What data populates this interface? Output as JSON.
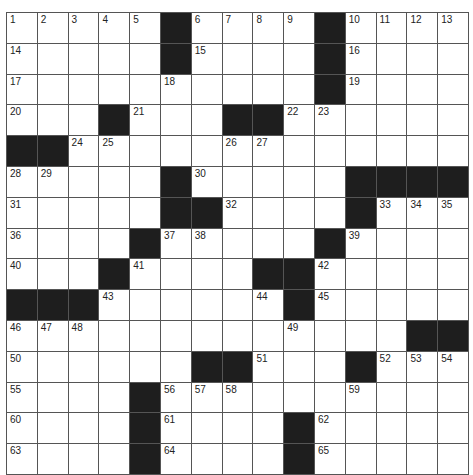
{
  "puzzle": {
    "rows": 15,
    "cols": 15,
    "colors": {
      "background": "#ffffff",
      "block": "#1e1e1e",
      "gridline": "#555555",
      "number": "#222222"
    },
    "grid": [
      [
        "1",
        "2",
        "3",
        "4",
        "5",
        "#",
        "6",
        "7",
        "8",
        "9",
        "#",
        "10",
        "11",
        "12",
        "13"
      ],
      [
        "14",
        "",
        "",
        "",
        "",
        "#",
        "15",
        "",
        "",
        "",
        "#",
        "16",
        "",
        "",
        ""
      ],
      [
        "17",
        "",
        "",
        "",
        "",
        "18",
        "",
        "",
        "",
        "",
        "#",
        "19",
        "",
        "",
        ""
      ],
      [
        "20",
        "",
        "",
        "#",
        "21",
        "",
        "",
        "#",
        "#",
        "22",
        "23",
        "",
        "",
        "",
        ""
      ],
      [
        "#",
        "#",
        "24",
        "25",
        "",
        "",
        "",
        "26",
        "27",
        "",
        "",
        "",
        "",
        "",
        ""
      ],
      [
        "28",
        "29",
        "",
        "",
        "",
        "#",
        "30",
        "",
        "",
        "",
        "",
        "#",
        "#",
        "#",
        "#"
      ],
      [
        "31",
        "",
        "",
        "",
        "",
        "#",
        "#",
        "32",
        "",
        "",
        "",
        "#",
        "33",
        "34",
        "35"
      ],
      [
        "36",
        "",
        "",
        "",
        "#",
        "37",
        "38",
        "",
        "",
        "",
        "#",
        "39",
        "",
        "",
        ""
      ],
      [
        "40",
        "",
        "",
        "#",
        "41",
        "",
        "",
        "",
        "#",
        "#",
        "42",
        "",
        "",
        "",
        ""
      ],
      [
        "#",
        "#",
        "#",
        "43",
        "",
        "",
        "",
        "",
        "44",
        "#",
        "45",
        "",
        "",
        "",
        ""
      ],
      [
        "46",
        "47",
        "48",
        "",
        "",
        "",
        "",
        "",
        "",
        "49",
        "",
        "",
        "",
        "#",
        "#"
      ],
      [
        "50",
        "",
        "",
        "",
        "",
        "",
        "#",
        "#",
        "51",
        "",
        "",
        "#",
        "52",
        "53",
        "54"
      ],
      [
        "55",
        "",
        "",
        "",
        "#",
        "56",
        "57",
        "58",
        "",
        "",
        "",
        "59",
        "",
        "",
        ""
      ],
      [
        "60",
        "",
        "",
        "",
        "#",
        "61",
        "",
        "",
        "",
        "#",
        "62",
        "",
        "",
        "",
        ""
      ],
      [
        "63",
        "",
        "",
        "",
        "#",
        "64",
        "",
        "",
        "",
        "#",
        "65",
        "",
        "",
        "",
        ""
      ]
    ],
    "letters": [
      [
        "",
        "",
        "",
        "",
        "",
        "",
        "",
        "",
        "",
        "",
        "",
        "",
        "",
        "",
        ""
      ],
      [
        "",
        "",
        "",
        "",
        "",
        "",
        "",
        "",
        "",
        "",
        "",
        "",
        "",
        "",
        ""
      ],
      [
        "",
        "",
        "",
        "",
        "",
        "",
        "",
        "",
        "",
        "",
        "",
        "",
        "",
        "",
        ""
      ],
      [
        "",
        "",
        "",
        "",
        "",
        "",
        "",
        "",
        "",
        "",
        "",
        "",
        "",
        "",
        ""
      ],
      [
        "",
        "",
        "",
        "",
        "",
        "",
        "",
        "",
        "",
        "",
        "",
        "",
        "",
        "",
        ""
      ],
      [
        "",
        "",
        "",
        "",
        "",
        "",
        "",
        "",
        "",
        "",
        "",
        "",
        "",
        "",
        ""
      ],
      [
        "",
        "",
        "",
        "",
        "",
        "",
        "",
        "",
        "",
        "",
        "",
        "",
        "",
        "",
        ""
      ],
      [
        "",
        "",
        "",
        "",
        "",
        "",
        "",
        "",
        "",
        "",
        "",
        "",
        "",
        "",
        ""
      ],
      [
        "",
        "",
        "",
        "",
        "",
        "",
        "",
        "",
        "",
        "",
        "",
        "",
        "",
        "",
        ""
      ],
      [
        "",
        "",
        "",
        "",
        "",
        "",
        "",
        "",
        "",
        "",
        "",
        "",
        "",
        "",
        ""
      ],
      [
        "",
        "",
        "",
        "",
        "",
        "",
        "",
        "",
        "",
        "",
        "",
        "",
        "",
        "",
        ""
      ],
      [
        "",
        "",
        "",
        "",
        "",
        "",
        "",
        "",
        "",
        "",
        "",
        "",
        "",
        "",
        ""
      ],
      [
        "",
        "",
        "",
        "",
        "",
        "",
        "",
        "",
        "",
        "",
        "",
        "",
        "",
        "",
        ""
      ],
      [
        "",
        "",
        "",
        "",
        "",
        "",
        "",
        "",
        "",
        "",
        "",
        "",
        "",
        "",
        ""
      ],
      [
        "",
        "",
        "",
        "",
        "",
        "",
        "",
        "",
        "",
        "",
        "",
        "",
        "",
        "",
        ""
      ]
    ]
  }
}
